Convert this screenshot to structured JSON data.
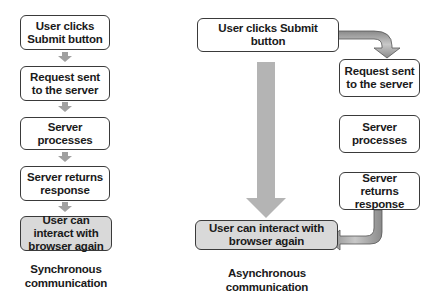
{
  "synchronous": {
    "steps": [
      {
        "label": "User clicks Submit button"
      },
      {
        "label": "Request sent to the server"
      },
      {
        "label": "Server processes"
      },
      {
        "label": "Server returns response"
      },
      {
        "label": "User can interact with browser again"
      }
    ],
    "caption": "Synchronous communication"
  },
  "asynchronous": {
    "steps": [
      {
        "label": "User clicks Submit button"
      },
      {
        "label": "Request sent to the server"
      },
      {
        "label": "Server processes"
      },
      {
        "label": "Server returns response"
      },
      {
        "label": "User can interact with browser again"
      }
    ],
    "caption": "Asynchronous communication"
  },
  "colors": {
    "box_border": "#3a3a3a",
    "final_box_fill": "#d9d9d9",
    "arrow_fill": "#a8a8a8"
  }
}
